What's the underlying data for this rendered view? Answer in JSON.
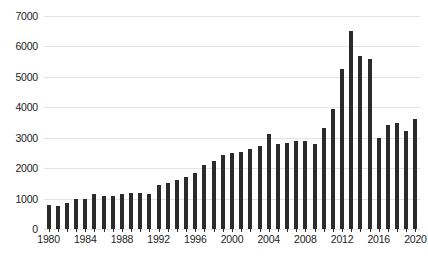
{
  "chart_data": {
    "type": "bar",
    "title": "",
    "subtitle": "",
    "xlabel": "",
    "ylabel": "",
    "grid": true,
    "legend": null,
    "bar_color": "#2b2b2b",
    "grid_color": "#e3e3e3",
    "text_color": "#1c1c1c",
    "ylim": [
      0,
      7000
    ],
    "xlim": [
      1980,
      2020
    ],
    "y_ticks": [
      0,
      1000,
      2000,
      3000,
      4000,
      5000,
      6000,
      7000
    ],
    "y_tick_labels": [
      "0",
      "1000",
      "2000",
      "3000",
      "4000",
      "5000",
      "6000",
      "7000"
    ],
    "x_ticks": [
      1980,
      1984,
      1988,
      1992,
      1996,
      2000,
      2004,
      2008,
      2012,
      2016,
      2020
    ],
    "x_tick_labels": [
      "1980",
      "1984",
      "1988",
      "1992",
      "1996",
      "2000",
      "2004",
      "2008",
      "2012",
      "2016",
      "2020"
    ],
    "categories": [
      "1980",
      "1981",
      "1982",
      "1983",
      "1984",
      "1985",
      "1986",
      "1987",
      "1988",
      "1989",
      "1990",
      "1991",
      "1992",
      "1993",
      "1994",
      "1995",
      "1996",
      "1997",
      "1998",
      "1999",
      "2000",
      "2001",
      "2002",
      "2003",
      "2004",
      "2005",
      "2006",
      "2007",
      "2008",
      "2009",
      "2010",
      "2011",
      "2012",
      "2013",
      "2014",
      "2015",
      "2016",
      "2017",
      "2018",
      "2019",
      "2020"
    ],
    "values": [
      780,
      760,
      850,
      1000,
      990,
      1140,
      1090,
      1100,
      1150,
      1180,
      1170,
      1160,
      1440,
      1520,
      1600,
      1720,
      1840,
      2110,
      2230,
      2420,
      2500,
      2530,
      2620,
      2720,
      3120,
      2780,
      2840,
      2880,
      2900,
      2790,
      3320,
      3950,
      5250,
      6500,
      5700,
      5600,
      3000,
      3420,
      3500,
      3230,
      3620
    ]
  }
}
